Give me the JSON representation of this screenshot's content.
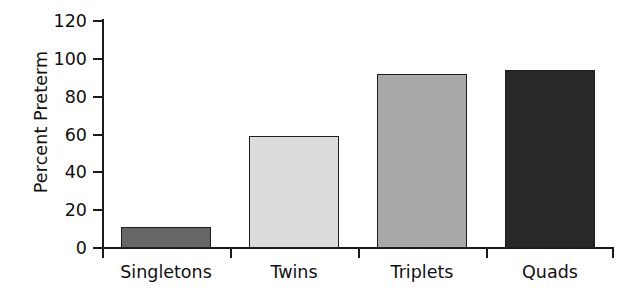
{
  "chart_data": {
    "type": "bar",
    "title": "",
    "xlabel": "",
    "ylabel": "Percent Preterm",
    "categories": [
      "Singletons",
      "Twins",
      "Triplets",
      "Quads"
    ],
    "values": [
      11,
      59,
      92,
      94
    ],
    "ylim": [
      0,
      120
    ],
    "yticks": [
      0,
      20,
      40,
      60,
      80,
      100,
      120
    ],
    "ytick_labels": [
      "0",
      "20",
      "40",
      "60",
      "80",
      "100",
      "120"
    ],
    "grid": false,
    "legend": "none",
    "bar_colors": [
      "#666666",
      "#dcdcdc",
      "#a8a8a8",
      "#282828"
    ],
    "bar_edge_color": "#1f1f1f",
    "axis_color": "#1a1a1a",
    "background_color": "#ffffff"
  }
}
